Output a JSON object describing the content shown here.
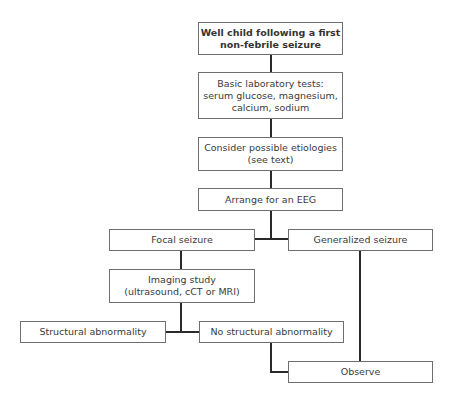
{
  "diagram": {
    "type": "flowchart",
    "nodes": {
      "start": {
        "line1": "Well child following a first",
        "line2": "non-febrile seizure"
      },
      "labs": {
        "line1": "Basic laboratory tests:",
        "line2": "serum glucose, magnesium,",
        "line3": "calcium, sodium"
      },
      "etiologies": {
        "line1": "Consider possible etiologies",
        "line2": "(see text)"
      },
      "eeg": {
        "label": "Arrange for an EEG"
      },
      "focal": {
        "label": "Focal seizure"
      },
      "generalized": {
        "label": "Generalized seizure"
      },
      "imaging": {
        "line1": "Imaging study",
        "line2": "(ultrasound, cCT or MRI)"
      },
      "structural": {
        "label": "Structural abnormality"
      },
      "no_structural": {
        "label": "No structural abnormality"
      },
      "observe": {
        "label": "Observe"
      }
    },
    "edges": [
      [
        "start",
        "labs"
      ],
      [
        "labs",
        "etiologies"
      ],
      [
        "etiologies",
        "eeg"
      ],
      [
        "eeg",
        "focal"
      ],
      [
        "eeg",
        "generalized"
      ],
      [
        "focal",
        "imaging"
      ],
      [
        "imaging",
        "structural"
      ],
      [
        "imaging",
        "no_structural"
      ],
      [
        "no_structural",
        "observe"
      ],
      [
        "generalized",
        "observe"
      ]
    ]
  }
}
